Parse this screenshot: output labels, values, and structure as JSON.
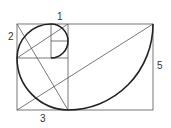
{
  "diagram": {
    "labels": {
      "one": "1",
      "two": "2",
      "three": "3",
      "five": "5"
    },
    "colors": {
      "line": "#444444",
      "spiral": "#222222",
      "background": "#ffffff"
    }
  }
}
